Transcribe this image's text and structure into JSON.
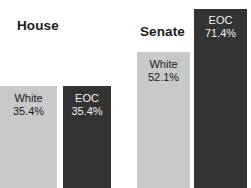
{
  "chart_data": {
    "type": "bar",
    "title": "",
    "xlabel": "",
    "ylabel": "",
    "categories": [
      "House",
      "Senate"
    ],
    "series": [
      {
        "name": "White",
        "values": [
          35.4,
          52.1
        ]
      },
      {
        "name": "EOC",
        "values": [
          35.4,
          71.4
        ]
      }
    ],
    "value_suffix": "%",
    "ylim": [
      0,
      75
    ],
    "grid": false,
    "legend": "none",
    "colors": {
      "white_series": "#c9c9c9",
      "eoc_series": "#333333",
      "background": "#ffffff",
      "title_text": "#1a1a1a",
      "light_bar_text": "#1a1a1a",
      "dark_bar_text": "#f2f2f2"
    }
  },
  "groups": {
    "house": {
      "title": "House",
      "bars": {
        "white": {
          "name": "White",
          "value": "35.4%"
        },
        "eoc": {
          "name": "EOC",
          "value": "35.4%"
        }
      }
    },
    "senate": {
      "title": "Senate",
      "bars": {
        "white": {
          "name": "White",
          "value": "52.1%"
        },
        "eoc": {
          "name": "EOC",
          "value": "71.4%"
        }
      }
    }
  }
}
